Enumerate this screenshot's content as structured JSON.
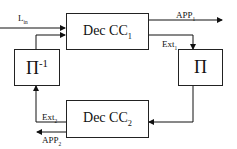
{
  "nodes": {
    "dec_cc1": {
      "label": "Dec CC",
      "sub": "1"
    },
    "dec_cc2": {
      "label": "Dec CC",
      "sub": "2"
    },
    "interleaver": {
      "label": "Π"
    },
    "deinterleaver": {
      "label": "Π",
      "sup": "-1"
    }
  },
  "edges": {
    "lin": {
      "label": "L",
      "sub": "in"
    },
    "app1": {
      "label": "APP",
      "sub": "1"
    },
    "ext1": {
      "label": "Ext",
      "sub": "1"
    },
    "ext2": {
      "label": "Ext",
      "sub": "2"
    },
    "app2": {
      "label": "APP",
      "sub": "2"
    }
  }
}
